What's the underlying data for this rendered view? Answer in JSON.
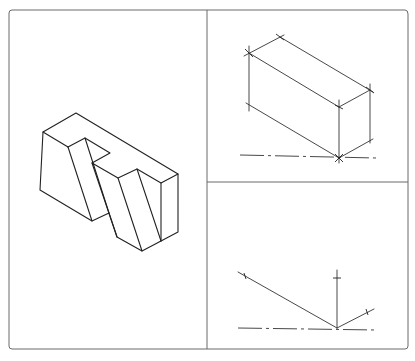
{
  "figure": {
    "title": "",
    "panels": [
      {
        "id": "isometric-object",
        "description": "Completed isometric view of notched block with inclined faces"
      },
      {
        "id": "step-box",
        "description": "Construction step: isometric enclosing box with corner tick marks"
      },
      {
        "id": "step-axes",
        "description": "Construction step: isometric axes from origin on baseline"
      }
    ]
  },
  "colors": {
    "line": "#222222",
    "frame": "#6a6a6a",
    "background": "#ffffff"
  }
}
